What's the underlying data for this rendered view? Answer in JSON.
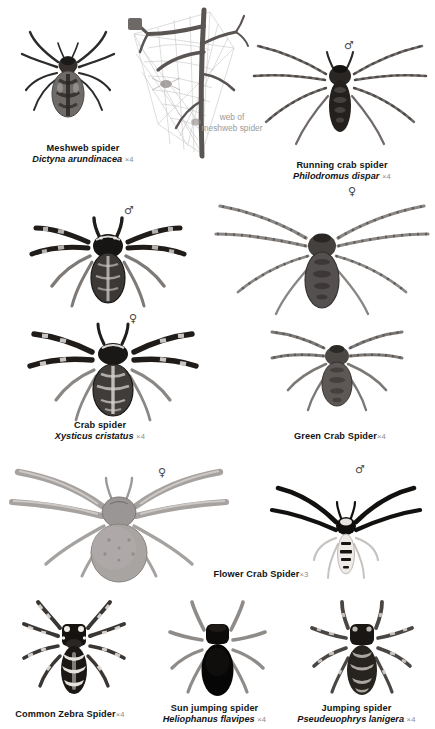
{
  "plate": {
    "title": "Spider identification plate",
    "background_color": "#ffffff",
    "ink_color": "#141414",
    "muted_color": "#8d8d8d"
  },
  "annotations": {
    "web_note_line1": "web of",
    "web_note_line2": "meshweb spider"
  },
  "symbols": {
    "male": "♂",
    "female": "♀"
  },
  "species": [
    {
      "id": "meshweb-spider",
      "common_name": "Meshweb spider",
      "scientific_name": "Dictyna arundinacea",
      "magnification": "×4",
      "sex": "",
      "tone": "dark"
    },
    {
      "id": "running-crab-spider",
      "common_name": "Running crab spider",
      "scientific_name": "Philodromus dispar",
      "magnification": "×4",
      "sex": "♂",
      "tone": "dark"
    },
    {
      "id": "crab-spider-male",
      "common_name": "",
      "scientific_name": "",
      "magnification": "",
      "sex": "♂",
      "tone": "dark"
    },
    {
      "id": "green-crab-spider-female-upper",
      "common_name": "",
      "scientific_name": "",
      "magnification": "",
      "sex": "♀",
      "tone": "mid"
    },
    {
      "id": "crab-spider",
      "common_name": "Crab spider",
      "scientific_name": "Xysticus cristatus",
      "magnification": "×4",
      "sex": "♀",
      "tone": "dark"
    },
    {
      "id": "green-crab-spider",
      "common_name": "Green Crab Spider",
      "scientific_name": "",
      "magnification": "×4",
      "sex": "",
      "tone": "mid"
    },
    {
      "id": "flower-crab-spider",
      "common_name": "Flower Crab Spider",
      "scientific_name": "",
      "magnification": "×3",
      "sex": "♀",
      "tone": "light"
    },
    {
      "id": "flower-crab-spider-male",
      "common_name": "",
      "scientific_name": "",
      "magnification": "",
      "sex": "♂",
      "tone": "contrast"
    },
    {
      "id": "common-zebra-spider",
      "common_name": "Common Zebra Spider",
      "scientific_name": "",
      "magnification": "×4",
      "sex": "",
      "tone": "dark"
    },
    {
      "id": "sun-jumping-spider",
      "common_name": "Sun jumping spider",
      "scientific_name": "Heliophanus flavipes",
      "magnification": "×4",
      "sex": "",
      "tone": "black"
    },
    {
      "id": "jumping-spider",
      "common_name": "Jumping spider",
      "scientific_name": "Pseudeuophrys lanigera",
      "magnification": "×4",
      "sex": "",
      "tone": "dark"
    }
  ]
}
